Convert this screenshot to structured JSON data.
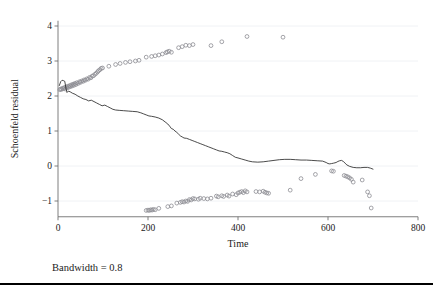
{
  "caption": "Bandwidth = 0.8",
  "colors": {
    "marker": "#8d8d93",
    "line": "#2b2b2b",
    "axis": "#6f6f6f",
    "grid": "#eceff3",
    "rule": "#000000",
    "background": "#ffffff"
  },
  "chart_data": {
    "type": "scatter",
    "title": "",
    "subtitle": "",
    "xlabel": "Time",
    "ylabel": "Schoenfeld residual",
    "xlim": [
      0,
      800
    ],
    "ylim": [
      -1.45,
      4.15
    ],
    "xticks": [
      0,
      200,
      400,
      600,
      800
    ],
    "yticks": [
      -1,
      0,
      1,
      2,
      3,
      4
    ],
    "xtick_labels": [
      "0",
      "200",
      "400",
      "600",
      "800"
    ],
    "ytick_labels": [
      "−1",
      "0",
      "1",
      "2",
      "3",
      "4"
    ],
    "grid": true,
    "legend": null,
    "annotations": [
      {
        "text": "Bandwidth = 0.8",
        "position": "below-axes-left"
      }
    ],
    "series": [
      {
        "name": "Schoenfeld residuals (upper band)",
        "type": "scatter",
        "marker": "open-circle",
        "color": "#8d8d93",
        "points": [
          [
            4,
            2.18
          ],
          [
            6,
            2.2
          ],
          [
            8,
            2.19
          ],
          [
            10,
            2.22
          ],
          [
            12,
            2.21
          ],
          [
            14,
            2.24
          ],
          [
            16,
            2.2
          ],
          [
            18,
            2.26
          ],
          [
            20,
            2.23
          ],
          [
            22,
            2.28
          ],
          [
            24,
            2.25
          ],
          [
            26,
            2.3
          ],
          [
            28,
            2.27
          ],
          [
            30,
            2.32
          ],
          [
            32,
            2.29
          ],
          [
            34,
            2.34
          ],
          [
            36,
            2.31
          ],
          [
            38,
            2.36
          ],
          [
            40,
            2.33
          ],
          [
            42,
            2.38
          ],
          [
            45,
            2.36
          ],
          [
            48,
            2.41
          ],
          [
            50,
            2.39
          ],
          [
            53,
            2.43
          ],
          [
            56,
            2.42
          ],
          [
            58,
            2.46
          ],
          [
            61,
            2.45
          ],
          [
            64,
            2.49
          ],
          [
            67,
            2.48
          ],
          [
            70,
            2.53
          ],
          [
            73,
            2.52
          ],
          [
            76,
            2.57
          ],
          [
            79,
            2.58
          ],
          [
            82,
            2.62
          ],
          [
            85,
            2.65
          ],
          [
            88,
            2.69
          ],
          [
            90,
            2.72
          ],
          [
            93,
            2.75
          ],
          [
            96,
            2.79
          ],
          [
            99,
            2.8
          ],
          [
            113,
            2.85
          ],
          [
            128,
            2.9
          ],
          [
            138,
            2.93
          ],
          [
            150,
            2.96
          ],
          [
            160,
            2.98
          ],
          [
            172,
            3.0
          ],
          [
            180,
            3.02
          ],
          [
            196,
            3.11
          ],
          [
            208,
            3.13
          ],
          [
            216,
            3.15
          ],
          [
            224,
            3.17
          ],
          [
            232,
            3.2
          ],
          [
            240,
            3.24
          ],
          [
            243,
            3.26
          ],
          [
            247,
            3.28
          ],
          [
            252,
            3.25
          ],
          [
            268,
            3.38
          ],
          [
            276,
            3.41
          ],
          [
            284,
            3.45
          ],
          [
            292,
            3.44
          ],
          [
            300,
            3.47
          ],
          [
            340,
            3.44
          ],
          [
            364,
            3.55
          ],
          [
            420,
            3.7
          ],
          [
            500,
            3.68
          ]
        ]
      },
      {
        "name": "Schoenfeld residuals (lower band)",
        "type": "scatter",
        "marker": "open-circle",
        "color": "#8d8d93",
        "points": [
          [
            196,
            -1.27
          ],
          [
            200,
            -1.26
          ],
          [
            203,
            -1.27
          ],
          [
            206,
            -1.25
          ],
          [
            209,
            -1.26
          ],
          [
            212,
            -1.24
          ],
          [
            216,
            -1.25
          ],
          [
            224,
            -1.21
          ],
          [
            244,
            -1.16
          ],
          [
            252,
            -1.14
          ],
          [
            264,
            -1.06
          ],
          [
            272,
            -1.04
          ],
          [
            276,
            -1.02
          ],
          [
            280,
            -1.03
          ],
          [
            284,
            -1.0
          ],
          [
            288,
            -1.01
          ],
          [
            292,
            -0.96
          ],
          [
            296,
            -0.97
          ],
          [
            300,
            -0.93
          ],
          [
            304,
            -0.94
          ],
          [
            312,
            -0.95
          ],
          [
            316,
            -0.92
          ],
          [
            324,
            -0.93
          ],
          [
            332,
            -0.94
          ],
          [
            340,
            -0.92
          ],
          [
            352,
            -0.86
          ],
          [
            356,
            -0.88
          ],
          [
            364,
            -0.85
          ],
          [
            368,
            -0.87
          ],
          [
            376,
            -0.83
          ],
          [
            380,
            -0.86
          ],
          [
            388,
            -0.8
          ],
          [
            396,
            -0.82
          ],
          [
            400,
            -0.77
          ],
          [
            404,
            -0.75
          ],
          [
            408,
            -0.73
          ],
          [
            412,
            -0.76
          ],
          [
            416,
            -0.71
          ],
          [
            420,
            -0.74
          ],
          [
            440,
            -0.73
          ],
          [
            448,
            -0.74
          ],
          [
            456,
            -0.72
          ],
          [
            460,
            -0.75
          ],
          [
            464,
            -0.77
          ],
          [
            468,
            -0.78
          ],
          [
            516,
            -0.69
          ],
          [
            540,
            -0.36
          ],
          [
            572,
            -0.24
          ],
          [
            608,
            -0.14
          ],
          [
            612,
            -0.15
          ],
          [
            636,
            -0.27
          ],
          [
            640,
            -0.29
          ],
          [
            644,
            -0.31
          ],
          [
            648,
            -0.34
          ],
          [
            652,
            -0.38
          ],
          [
            656,
            -0.46
          ],
          [
            676,
            -0.4
          ],
          [
            688,
            -0.74
          ],
          [
            692,
            -0.85
          ],
          [
            696,
            -1.2
          ]
        ]
      },
      {
        "name": "Smoothed estimate",
        "type": "line",
        "color": "#2b2b2b",
        "points": [
          [
            3,
            2.3
          ],
          [
            6,
            2.41
          ],
          [
            9,
            2.45
          ],
          [
            12,
            2.44
          ],
          [
            15,
            2.42
          ],
          [
            18,
            2.2
          ],
          [
            20,
            2.1
          ],
          [
            23,
            2.14
          ],
          [
            27,
            2.12
          ],
          [
            32,
            2.08
          ],
          [
            38,
            2.05
          ],
          [
            44,
            2.0
          ],
          [
            50,
            1.96
          ],
          [
            56,
            1.92
          ],
          [
            62,
            1.9
          ],
          [
            68,
            1.86
          ],
          [
            74,
            1.88
          ],
          [
            80,
            1.84
          ],
          [
            86,
            1.8
          ],
          [
            92,
            1.76
          ],
          [
            98,
            1.72
          ],
          [
            104,
            1.74
          ],
          [
            110,
            1.7
          ],
          [
            116,
            1.66
          ],
          [
            122,
            1.62
          ],
          [
            128,
            1.6
          ],
          [
            136,
            1.59
          ],
          [
            146,
            1.58
          ],
          [
            156,
            1.57
          ],
          [
            166,
            1.56
          ],
          [
            176,
            1.55
          ],
          [
            184,
            1.52
          ],
          [
            190,
            1.49
          ],
          [
            196,
            1.46
          ],
          [
            202,
            1.43
          ],
          [
            208,
            1.42
          ],
          [
            216,
            1.4
          ],
          [
            224,
            1.37
          ],
          [
            232,
            1.32
          ],
          [
            238,
            1.26
          ],
          [
            244,
            1.2
          ],
          [
            248,
            1.14
          ],
          [
            252,
            1.07
          ],
          [
            256,
            1.05
          ],
          [
            260,
            1.0
          ],
          [
            264,
            0.96
          ],
          [
            268,
            0.91
          ],
          [
            272,
            0.86
          ],
          [
            276,
            0.83
          ],
          [
            280,
            0.8
          ],
          [
            286,
            0.79
          ],
          [
            292,
            0.76
          ],
          [
            298,
            0.73
          ],
          [
            304,
            0.7
          ],
          [
            310,
            0.67
          ],
          [
            316,
            0.64
          ],
          [
            322,
            0.61
          ],
          [
            328,
            0.58
          ],
          [
            334,
            0.55
          ],
          [
            340,
            0.52
          ],
          [
            346,
            0.49
          ],
          [
            352,
            0.46
          ],
          [
            358,
            0.43
          ],
          [
            364,
            0.42
          ],
          [
            370,
            0.4
          ],
          [
            376,
            0.38
          ],
          [
            382,
            0.35
          ],
          [
            388,
            0.3
          ],
          [
            394,
            0.25
          ],
          [
            400,
            0.23
          ],
          [
            408,
            0.2
          ],
          [
            416,
            0.17
          ],
          [
            424,
            0.14
          ],
          [
            432,
            0.12
          ],
          [
            444,
            0.11
          ],
          [
            456,
            0.12
          ],
          [
            468,
            0.14
          ],
          [
            480,
            0.16
          ],
          [
            492,
            0.18
          ],
          [
            504,
            0.19
          ],
          [
            516,
            0.19
          ],
          [
            528,
            0.18
          ],
          [
            540,
            0.17
          ],
          [
            552,
            0.17
          ],
          [
            564,
            0.16
          ],
          [
            576,
            0.15
          ],
          [
            588,
            0.14
          ],
          [
            596,
            0.1
          ],
          [
            600,
            0.07
          ],
          [
            604,
            0.06
          ],
          [
            608,
            0.07
          ],
          [
            612,
            0.08
          ],
          [
            618,
            0.1
          ],
          [
            622,
            0.13
          ],
          [
            626,
            0.15
          ],
          [
            630,
            0.16
          ],
          [
            634,
            0.13
          ],
          [
            638,
            0.08
          ],
          [
            642,
            0.03
          ],
          [
            648,
            -0.01
          ],
          [
            656,
            -0.04
          ],
          [
            664,
            -0.05
          ],
          [
            672,
            -0.05
          ],
          [
            680,
            -0.04
          ],
          [
            688,
            -0.04
          ],
          [
            694,
            -0.06
          ],
          [
            700,
            -0.09
          ]
        ]
      }
    ]
  }
}
